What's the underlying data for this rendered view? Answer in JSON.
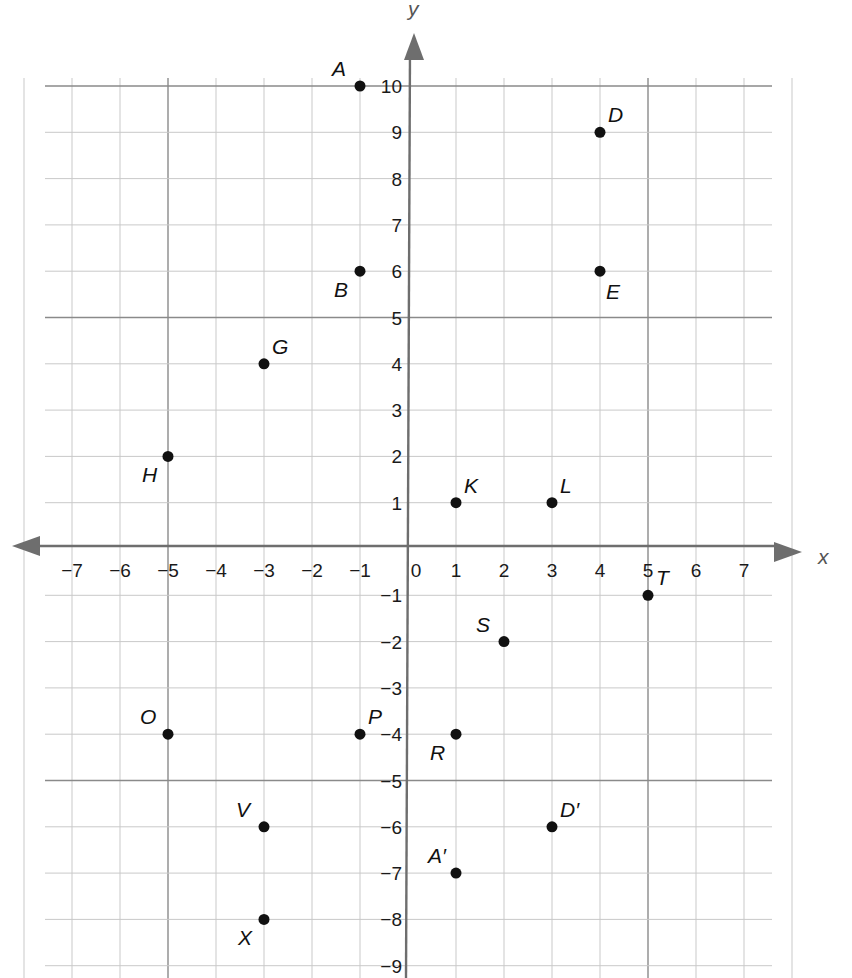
{
  "chart_data": {
    "type": "scatter",
    "title": "",
    "xlabel": "x",
    "ylabel": "y",
    "xlim": [
      -7,
      7
    ],
    "ylim": [
      -9,
      10
    ],
    "grid": true,
    "x_ticks": [
      -7,
      -6,
      -5,
      -4,
      -3,
      -2,
      -1,
      0,
      1,
      2,
      3,
      4,
      5,
      6,
      7
    ],
    "x_tick_labels": [
      "−7",
      "−6",
      "−5",
      "−4",
      "−3",
      "−2",
      "−1",
      "0",
      "1",
      "2",
      "3",
      "4",
      "5",
      "6",
      "7"
    ],
    "y_ticks": [
      10,
      9,
      8,
      7,
      6,
      5,
      4,
      3,
      2,
      1,
      -1,
      -2,
      -3,
      -4,
      -5,
      -6,
      -7,
      -8,
      -9
    ],
    "y_tick_labels": [
      "10",
      "9",
      "8",
      "7",
      "6",
      "5",
      "4",
      "3",
      "2",
      "1",
      "−1",
      "−2",
      "−3",
      "−4",
      "−5",
      "−6",
      "−7",
      "−8",
      "−9"
    ],
    "points": [
      {
        "label": "A",
        "x": -1,
        "y": 10,
        "label_pos": "upper-left"
      },
      {
        "label": "B",
        "x": -1,
        "y": 6,
        "label_pos": "lower-left"
      },
      {
        "label": "D",
        "x": 4,
        "y": 9,
        "label_pos": "upper-right"
      },
      {
        "label": "E",
        "x": 4,
        "y": 6,
        "label_pos": "lower-right"
      },
      {
        "label": "G",
        "x": -3,
        "y": 4,
        "label_pos": "upper-right"
      },
      {
        "label": "H",
        "x": -5,
        "y": 2,
        "label_pos": "lower-left"
      },
      {
        "label": "K",
        "x": 1,
        "y": 1,
        "label_pos": "upper-right"
      },
      {
        "label": "L",
        "x": 3,
        "y": 1,
        "label_pos": "upper-right"
      },
      {
        "label": "T",
        "x": 5,
        "y": -1,
        "label_pos": "upper-right"
      },
      {
        "label": "S",
        "x": 2,
        "y": -2,
        "label_pos": "upper-left"
      },
      {
        "label": "O",
        "x": -5,
        "y": -4,
        "label_pos": "upper-left"
      },
      {
        "label": "P",
        "x": -1,
        "y": -4,
        "label_pos": "upper-right"
      },
      {
        "label": "R",
        "x": 1,
        "y": -4,
        "label_pos": "lower-left"
      },
      {
        "label": "V",
        "x": -3,
        "y": -6,
        "label_pos": "upper-left"
      },
      {
        "label": "D′",
        "x": 3,
        "y": -6,
        "label_pos": "upper-right"
      },
      {
        "label": "A′",
        "x": 1,
        "y": -7,
        "label_pos": "upper-left"
      },
      {
        "label": "X",
        "x": -3,
        "y": -8,
        "label_pos": "lower-left"
      }
    ]
  }
}
